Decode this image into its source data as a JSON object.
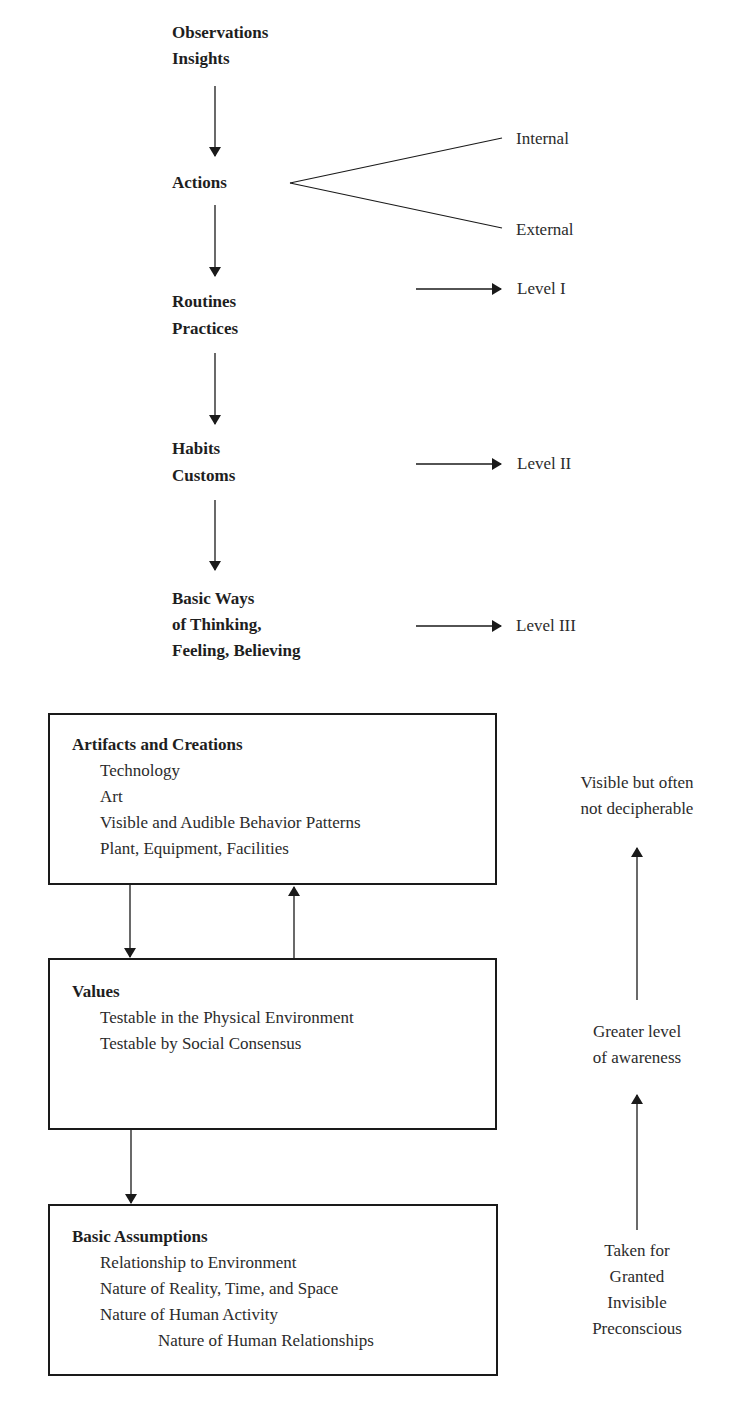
{
  "flow": {
    "stage1": [
      "Observations",
      "Insights"
    ],
    "stage2": [
      "Actions"
    ],
    "stage2_branches": [
      "Internal",
      "External"
    ],
    "stage3": [
      "Routines",
      "Practices"
    ],
    "stage4": [
      "Habits",
      "Customs"
    ],
    "stage5": [
      "Basic Ways",
      "of Thinking,",
      "Feeling, Believing"
    ],
    "levels": [
      "Level I",
      "Level II",
      "Level III"
    ]
  },
  "boxes": {
    "artifacts": {
      "title": "Artifacts and Creations",
      "items": [
        "Technology",
        "Art",
        "Visible and Audible Behavior Patterns",
        "Plant, Equipment, Facilities"
      ]
    },
    "values": {
      "title": "Values",
      "items": [
        "Testable in the Physical Environment",
        "Testable by Social Consensus"
      ]
    },
    "assumptions": {
      "title": "Basic Assumptions",
      "items": [
        "Relationship to Environment",
        "Nature of Reality, Time, and Space",
        "Nature of Human Activity",
        "Nature of Human Relationships"
      ]
    }
  },
  "awareness": {
    "top": [
      "Visible but often",
      "not decipherable"
    ],
    "middle": [
      "Greater level",
      "of awareness"
    ],
    "bottom": [
      "Taken for",
      "Granted",
      "Invisible",
      "Preconscious"
    ]
  },
  "colors": {
    "line": "#1a1a1a",
    "text": "#2b2b2b"
  }
}
